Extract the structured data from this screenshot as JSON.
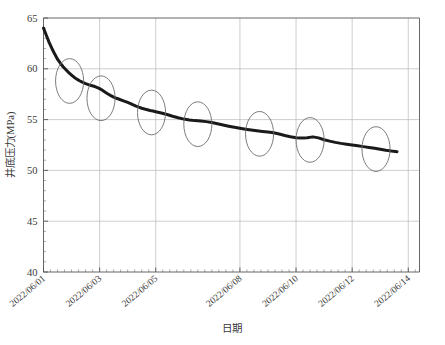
{
  "chart_data": {
    "type": "line",
    "title": "",
    "xlabel": "日期",
    "ylabel": "井底压力(MPa)",
    "ylim": [
      40,
      65
    ],
    "yticks": [
      40,
      45,
      50,
      55,
      60,
      65
    ],
    "ytick_labels": [
      "40",
      "45",
      "50",
      "55",
      "60",
      "65"
    ],
    "xlim": [
      "2022/06/01",
      "2022/06/14"
    ],
    "xticks": [
      "2022/06/01",
      "2022/06/03",
      "2022/06/05",
      "2022/06/08",
      "2022/06/10",
      "2022/06/12",
      "2022/06/14"
    ],
    "xtick_positions_days": [
      0,
      2,
      4,
      7,
      9,
      11,
      13
    ],
    "grid": true,
    "grid_axis": "both",
    "legend": false,
    "minor_ticks_per_major_x": 8,
    "minor_ticks_per_major_y": 5,
    "series": [
      {
        "name": "井底压力",
        "color": "#1a1a1a",
        "line_width": 3,
        "x_days": [
          0.0,
          0.1,
          0.2,
          0.3,
          0.4,
          0.5,
          0.6,
          0.7,
          0.8,
          0.9,
          1.0,
          1.1,
          1.2,
          1.3,
          1.4,
          1.5,
          1.6,
          1.7,
          1.8,
          1.9,
          2.0,
          2.1,
          2.2,
          2.3,
          2.4,
          2.5,
          2.6,
          2.7,
          2.8,
          2.9,
          3.0,
          3.1,
          3.2,
          3.3,
          3.4,
          3.5,
          3.6,
          3.7,
          3.8,
          3.9,
          4.0,
          4.2,
          4.4,
          4.6,
          4.8,
          5.0,
          5.2,
          5.4,
          5.6,
          5.8,
          6.0,
          6.2,
          6.4,
          6.6,
          6.8,
          7.0,
          7.2,
          7.4,
          7.6,
          7.8,
          8.0,
          8.2,
          8.4,
          8.6,
          8.8,
          9.0,
          9.2,
          9.4,
          9.6,
          9.8,
          10.0,
          10.2,
          10.4,
          10.6,
          10.8,
          11.0,
          11.2,
          11.4,
          11.6,
          11.8,
          12.0,
          12.2,
          12.4,
          12.6
        ],
        "y_mpa": [
          64.0,
          63.3,
          62.6,
          62.0,
          61.45,
          60.95,
          60.55,
          60.2,
          59.9,
          59.62,
          59.38,
          59.15,
          58.96,
          58.8,
          58.66,
          58.54,
          58.44,
          58.36,
          58.28,
          58.18,
          58.05,
          57.88,
          57.7,
          57.52,
          57.36,
          57.22,
          57.1,
          57.0,
          56.9,
          56.8,
          56.7,
          56.58,
          56.45,
          56.33,
          56.22,
          56.12,
          56.04,
          55.97,
          55.9,
          55.84,
          55.78,
          55.65,
          55.5,
          55.33,
          55.18,
          55.05,
          54.96,
          54.9,
          54.86,
          54.8,
          54.72,
          54.6,
          54.47,
          54.35,
          54.24,
          54.14,
          54.05,
          53.97,
          53.9,
          53.84,
          53.78,
          53.7,
          53.58,
          53.44,
          53.32,
          53.22,
          53.18,
          53.22,
          53.3,
          53.2,
          53.02,
          52.88,
          52.76,
          52.66,
          52.58,
          52.5,
          52.42,
          52.34,
          52.26,
          52.18,
          52.08,
          51.98,
          51.9,
          51.84
        ]
      }
    ],
    "annotations": {
      "shape": "ellipse",
      "stroke": "#6d6d6d",
      "fill": "none",
      "items": [
        {
          "cx_days": 0.93,
          "cy_mpa": 58.8,
          "rx_days": 0.5,
          "ry_mpa": 2.2
        },
        {
          "cx_days": 2.05,
          "cy_mpa": 57.1,
          "rx_days": 0.5,
          "ry_mpa": 2.2
        },
        {
          "cx_days": 3.85,
          "cy_mpa": 55.7,
          "rx_days": 0.5,
          "ry_mpa": 2.2
        },
        {
          "cx_days": 5.5,
          "cy_mpa": 54.55,
          "rx_days": 0.5,
          "ry_mpa": 2.2
        },
        {
          "cx_days": 7.7,
          "cy_mpa": 53.6,
          "rx_days": 0.5,
          "ry_mpa": 2.2
        },
        {
          "cx_days": 9.5,
          "cy_mpa": 53.0,
          "rx_days": 0.5,
          "ry_mpa": 2.2
        },
        {
          "cx_days": 11.85,
          "cy_mpa": 52.1,
          "rx_days": 0.5,
          "ry_mpa": 2.2
        }
      ]
    },
    "colors": {
      "curve": "#1a1a1a",
      "grid": "#b9b9b9",
      "axis": "#555555",
      "annotation": "#6d6d6d",
      "text": "#3a3a3a",
      "background": "#ffffff"
    }
  }
}
